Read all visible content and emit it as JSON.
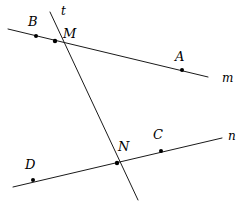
{
  "figure": {
    "width": 246,
    "height": 206,
    "background_color": "#ffffff",
    "stroke_color": "#1a1a1a",
    "point_color": "#000000"
  },
  "lines": [
    {
      "id": "m",
      "label": "m",
      "label_x": 222,
      "label_y": 72,
      "x1": 8,
      "y1": 29,
      "x2": 208,
      "y2": 77
    },
    {
      "id": "n",
      "label": "n",
      "label_x": 228,
      "label_y": 130,
      "x1": 13,
      "y1": 187,
      "x2": 222,
      "y2": 138
    },
    {
      "id": "t",
      "label": "t",
      "label_x": 61,
      "label_y": 5,
      "x1": 50,
      "y1": 12,
      "x2": 138,
      "y2": 200
    }
  ],
  "points": [
    {
      "id": "B",
      "label": "B",
      "cx": 36,
      "cy": 36,
      "label_x": 28,
      "label_y": 15
    },
    {
      "id": "M",
      "label": "M",
      "cx": 55,
      "cy": 41,
      "label_x": 63,
      "label_y": 27
    },
    {
      "id": "A",
      "label": "A",
      "cx": 182,
      "cy": 70,
      "label_x": 175,
      "label_y": 50
    },
    {
      "id": "N",
      "label": "N",
      "cx": 117,
      "cy": 163,
      "label_x": 118,
      "label_y": 140
    },
    {
      "id": "C",
      "label": "C",
      "cx": 161,
      "cy": 151,
      "label_x": 153,
      "label_y": 128
    },
    {
      "id": "D",
      "label": "D",
      "cx": 33,
      "cy": 180,
      "label_x": 25,
      "label_y": 158
    }
  ]
}
